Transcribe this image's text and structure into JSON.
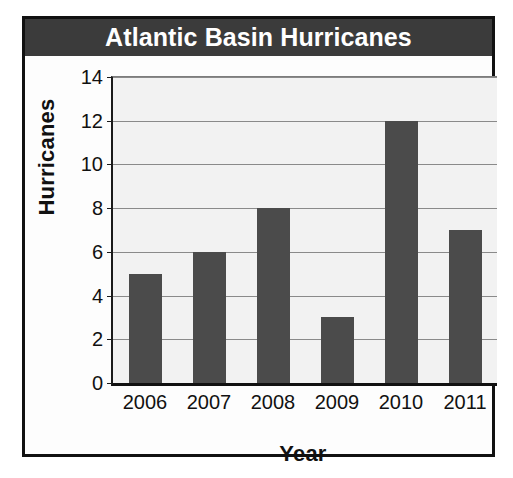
{
  "chart_data": {
    "type": "bar",
    "title": "Atlantic Basin Hurricanes",
    "xlabel": "Year",
    "ylabel": "Hurricanes",
    "categories": [
      "2006",
      "2007",
      "2008",
      "2009",
      "2010",
      "2011"
    ],
    "values": [
      5,
      6,
      8,
      3,
      12,
      7
    ],
    "ylim": [
      0,
      14
    ],
    "ytick_labels": [
      "0",
      "2",
      "4",
      "6",
      "8",
      "10",
      "12",
      "14"
    ],
    "ytick_values": [
      0,
      2,
      4,
      6,
      8,
      10,
      12,
      14
    ],
    "grid": true,
    "legend": false,
    "colors": {
      "bar": "#4b4b4b",
      "title_banner": "#3b3b3b",
      "title_text": "#ffffff",
      "plot_background": "#f2f2f2",
      "gridline": "#8a8a8a",
      "axis": "#111111",
      "frame": "#111111",
      "page_background": "#ffffff"
    }
  }
}
